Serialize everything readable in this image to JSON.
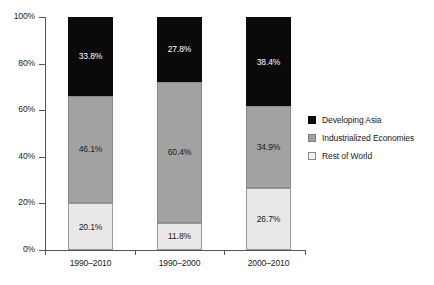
{
  "chart_data": {
    "type": "bar",
    "subtype": "stacked-bar-100-percent",
    "title": "",
    "xlabel": "",
    "ylabel": "",
    "ylim": [
      0,
      100
    ],
    "yticks": [
      "0%",
      "20%",
      "40%",
      "60%",
      "80%",
      "100%"
    ],
    "ytick_values": [
      0,
      20,
      40,
      60,
      80,
      100
    ],
    "grid": false,
    "legend_position": "right",
    "categories": [
      "1990–2010",
      "1990–2000",
      "2000–2010"
    ],
    "series": [
      {
        "name": "Rest of World",
        "color": "#e8e8e8",
        "values": [
          20.1,
          11.8,
          26.7
        ],
        "labels": [
          "20.1%",
          "11.8%",
          "26.7%"
        ]
      },
      {
        "name": "Industrialized Economies",
        "color": "#a2a2a2",
        "values": [
          46.1,
          60.4,
          34.9
        ],
        "labels": [
          "46.1%",
          "60.4%",
          "34.9%"
        ]
      },
      {
        "name": "Developing Asia",
        "color": "#0a0a0a",
        "values": [
          33.8,
          27.8,
          38.4
        ],
        "labels": [
          "33.8%",
          "27.8%",
          "38.4%"
        ]
      }
    ],
    "stack_order_bottom_to_top": [
      "Rest of World",
      "Industrialized Economies",
      "Developing Asia"
    ],
    "legend": [
      {
        "label": "Developing Asia",
        "color": "#0a0a0a",
        "swatch": "dark"
      },
      {
        "label": "Industrialized Economies",
        "color": "#a2a2a2",
        "swatch": "mid"
      },
      {
        "label": "Rest of World",
        "color": "#e8e8e8",
        "swatch": "light"
      }
    ]
  },
  "axes": {
    "y_tick_labels": [
      "100%",
      "80%",
      "60%",
      "40%",
      "20%",
      "0%"
    ],
    "x_tick_labels": [
      "1990–2010",
      "1990–2000",
      "2000–2010"
    ]
  },
  "bars": [
    {
      "category": "1990–2010",
      "segments": [
        {
          "series": "Developing Asia",
          "value": 33.8,
          "label": "33.8%",
          "swatch": "dark"
        },
        {
          "series": "Industrialized Economies",
          "value": 46.1,
          "label": "46.1%",
          "swatch": "mid"
        },
        {
          "series": "Rest of World",
          "value": 20.1,
          "label": "20.1%",
          "swatch": "light"
        }
      ]
    },
    {
      "category": "1990–2000",
      "segments": [
        {
          "series": "Developing Asia",
          "value": 27.8,
          "label": "27.8%",
          "swatch": "dark"
        },
        {
          "series": "Industrialized Economies",
          "value": 60.4,
          "label": "60.4%",
          "swatch": "mid"
        },
        {
          "series": "Rest of World",
          "value": 11.8,
          "label": "11.8%",
          "swatch": "light"
        }
      ]
    },
    {
      "category": "2000–2010",
      "segments": [
        {
          "series": "Developing Asia",
          "value": 38.4,
          "label": "38.4%",
          "swatch": "dark"
        },
        {
          "series": "Industrialized Economies",
          "value": 34.9,
          "label": "34.9%",
          "swatch": "mid"
        },
        {
          "series": "Rest of World",
          "value": 26.7,
          "label": "26.7%",
          "swatch": "light"
        }
      ]
    }
  ]
}
